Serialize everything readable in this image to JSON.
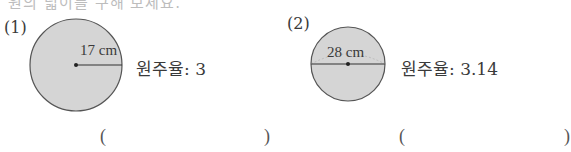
{
  "header": {
    "cut_off_text": "원의 넓이를 구해 보세요."
  },
  "problems": [
    {
      "number": "(1)",
      "figure": {
        "shape": "circle",
        "measure_type": "radius",
        "measure_label": "17 cm"
      },
      "pi_text": "원주율: 3",
      "answer": {
        "open": "(",
        "value": "",
        "close": ")"
      }
    },
    {
      "number": "(2)",
      "figure": {
        "shape": "circle",
        "measure_type": "diameter",
        "measure_label": "28 cm"
      },
      "pi_text": "원주율: 3.14",
      "answer": {
        "open": "(",
        "value": "",
        "close": ")"
      }
    }
  ],
  "colors": {
    "circle_fill": "#d5d5d5",
    "circle_stroke": "#555555",
    "text": "#3a3a3a"
  }
}
